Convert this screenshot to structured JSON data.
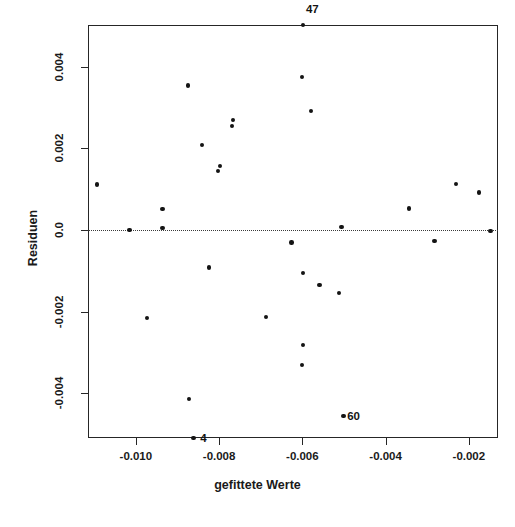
{
  "chart_data": {
    "type": "scatter",
    "title": "",
    "subtitle": "",
    "xlabel": "gefittete Werte",
    "ylabel": "Residuen",
    "xticks": [
      "-0.010",
      "-0.008",
      "-0.006",
      "-0.004",
      "-0.002"
    ],
    "xtick_values": [
      -0.01,
      -0.008,
      -0.006,
      -0.004,
      -0.002
    ],
    "yticks": [
      "0.004",
      "0.002",
      "0.0",
      "-0.002",
      "-0.004"
    ],
    "ytick_values": [
      0.004,
      0.002,
      0.0,
      -0.002,
      -0.004
    ],
    "xlim": [
      -0.01115,
      -0.0013
    ],
    "ylim": [
      -0.00509,
      0.00502
    ],
    "grid": false,
    "legend": null,
    "reference_lines": [
      {
        "orientation": "horizontal",
        "value": 0.0,
        "style": "dotted"
      }
    ],
    "marker": "filled-circle",
    "marker_color": "#141414",
    "frame_color": "#262626",
    "background": "#ffffff",
    "points": [
      {
        "x": -0.01093,
        "y": 0.00112
      },
      {
        "x": -0.01015,
        "y": 0.0
      },
      {
        "x": -0.00974,
        "y": -0.00215
      },
      {
        "x": -0.00936,
        "y": 0.00051
      },
      {
        "x": -0.00936,
        "y": 5e-05
      },
      {
        "x": -0.00875,
        "y": 0.00354
      },
      {
        "x": -0.00872,
        "y": -0.00414
      },
      {
        "x": -0.00862,
        "y": -0.00509
      },
      {
        "x": -0.00841,
        "y": 0.00208
      },
      {
        "x": -0.00825,
        "y": -0.00092
      },
      {
        "x": -0.00803,
        "y": 0.00145
      },
      {
        "x": -0.00798,
        "y": 0.00157
      },
      {
        "x": -0.00769,
        "y": 0.00255
      },
      {
        "x": -0.00766,
        "y": 0.0027
      },
      {
        "x": -0.00688,
        "y": -0.00213
      },
      {
        "x": -0.00626,
        "y": -0.0003
      },
      {
        "x": -0.00601,
        "y": 0.00374
      },
      {
        "x": -0.00599,
        "y": -0.00105
      },
      {
        "x": -0.00598,
        "y": -0.00282
      },
      {
        "x": -0.00598,
        "y": 0.00502
      },
      {
        "x": -0.00601,
        "y": -0.00331
      },
      {
        "x": -0.00579,
        "y": 0.00291
      },
      {
        "x": -0.00559,
        "y": -0.00134
      },
      {
        "x": -0.00512,
        "y": -0.00154
      },
      {
        "x": -0.00506,
        "y": 7e-05
      },
      {
        "x": -0.00501,
        "y": -0.00455
      },
      {
        "x": -0.00344,
        "y": 0.00053
      },
      {
        "x": -0.00283,
        "y": -0.00027
      },
      {
        "x": -0.00231,
        "y": 0.00113
      },
      {
        "x": -0.00176,
        "y": 0.00092
      },
      {
        "x": -0.00148,
        "y": -3e-05
      }
    ],
    "point_labels": [
      {
        "text": "47",
        "x": -0.00598,
        "y": 0.00502,
        "offset": "above-right"
      },
      {
        "text": "4",
        "x": -0.00862,
        "y": -0.00509,
        "offset": "right"
      },
      {
        "text": "60",
        "x": -0.00501,
        "y": -0.00455,
        "offset": "right"
      }
    ]
  }
}
